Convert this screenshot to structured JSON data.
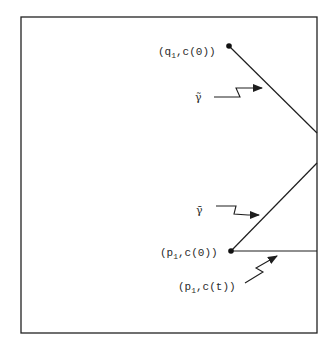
{
  "figure": {
    "frame": {
      "x1": 21,
      "y1": 17,
      "x2": 317,
      "y2": 333,
      "color": "#222222"
    },
    "ink_color": "#1e1e1e",
    "points": {
      "q1_c0": {
        "label_base": "(q",
        "label_sub": "1",
        "label_rest": ",c(0))",
        "x": 229,
        "y": 46
      },
      "p1_c0": {
        "label_base": "(p",
        "label_sub": "1",
        "label_rest": ",c(0))",
        "x": 231,
        "y": 251
      },
      "p1_ct": {
        "label_base": "(p",
        "label_sub": "1",
        "label_rest": ",c(t))"
      }
    },
    "curves": {
      "gamma_tilde": {
        "symbol": "γ̃",
        "label": "gamma-tilde",
        "from": [
          229,
          46
        ],
        "to": [
          317,
          133
        ]
      },
      "gamma_bar": {
        "symbol": "γ̄",
        "label": "gamma-bar",
        "from": [
          231,
          251
        ],
        "to": [
          317,
          163
        ]
      },
      "horizontal": {
        "label": "p1-c(t) path",
        "from": [
          231,
          251
        ],
        "to": [
          317,
          251
        ]
      }
    }
  }
}
